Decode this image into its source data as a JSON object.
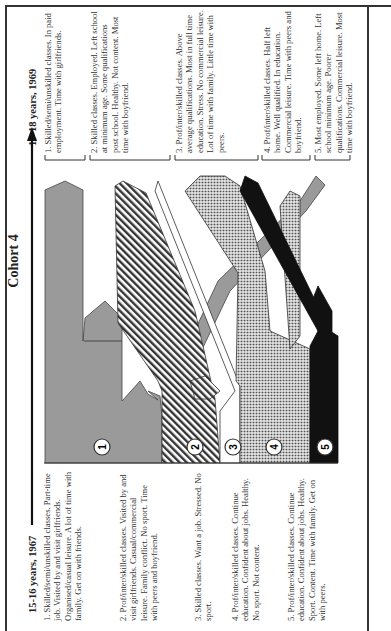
{
  "figure": {
    "title": "Cohort 4",
    "start_label": "15-16 years, 1967",
    "end_label": "17-18 years, 1969",
    "colors": {
      "band1_grey": "#9a9a9a",
      "band2_hatch": "#333333",
      "band3_white": "#ffffff",
      "band4_dots": "#cfcfcf",
      "band5_black": "#111111",
      "frame": "#333333"
    },
    "start_groups": [
      {
        "number": "1",
        "text": "1. Skilled/semi/unskilled classes. Part-time job. Visited by and visit girlfriends. Organised/casual leisure. A lot of time with family. Get on with friends."
      },
      {
        "number": "2",
        "text": "2. Prof/inter/skilled classes. Visited by and visit girlfriends. Casual/commercial leisure. Family conflict. No sport. Time with peers and boyfriend."
      },
      {
        "number": "3",
        "text": "3. Skilled classes. Want a job. Stressed. No sport."
      },
      {
        "number": "4",
        "text": "4. Prof/inter/skilled classes. Continue education. Confident about jobs. Healthy. No sport. Not content."
      },
      {
        "number": "5",
        "text": "5. Prof/inter/skilled classes. Continue education. Confident about jobs. Healthy. Sport. Content. Time with family. Get on with peers."
      }
    ],
    "end_groups": [
      {
        "number": "1",
        "text": "1. Skilled/semi/unskilled classes. In paid employment. Time with girlfriends."
      },
      {
        "number": "2",
        "text": "2. Skilled classes. Employed. Left school at minimum age. Some qualifications post school. Healthy. Not content. Most time with boyfriend."
      },
      {
        "number": "3",
        "text": "3. Prof/inter/skilled classes. Above average qualifications. Most in full time education. Stress. No commercial leisure. Lot of time with family. Little time with peers."
      },
      {
        "number": "4",
        "text": "4. Prof/inter/skilled classes. Half left home. Well qualified. In education. Commercial leisure. Time with peers and boyfriend."
      },
      {
        "number": "5",
        "text": "5. Most employed. Some left home. Left school minimum age. Poorer qualifications. Commercial leisure. Most time with boyfriend."
      }
    ],
    "band_markers": [
      "1",
      "2",
      "3",
      "4",
      "5"
    ]
  }
}
